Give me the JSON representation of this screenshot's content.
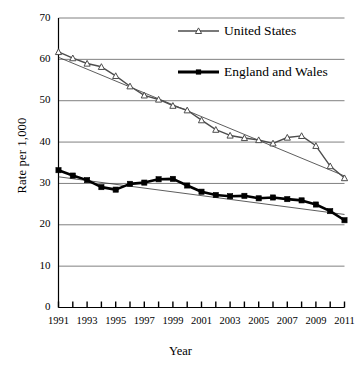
{
  "chart_data": {
    "type": "line",
    "title": "",
    "xlabel": "Year",
    "ylabel": "Rate per 1,000",
    "xlim": [
      1991,
      2011
    ],
    "ylim": [
      0,
      70
    ],
    "yticks": [
      0,
      10,
      20,
      30,
      40,
      50,
      60,
      70
    ],
    "xticks": [
      1991,
      1992,
      1993,
      1994,
      1995,
      1996,
      1997,
      1998,
      1999,
      2000,
      2001,
      2002,
      2003,
      2004,
      2005,
      2006,
      2007,
      2008,
      2009,
      2010,
      2011
    ],
    "xtick_labels_shown": [
      "1991",
      "1993",
      "1995",
      "1997",
      "1999",
      "2001",
      "2003",
      "2005",
      "2007",
      "2009",
      "2011"
    ],
    "grid": "horizontal",
    "legend_position": "upper-right-inside",
    "x": [
      1991,
      1992,
      1993,
      1994,
      1995,
      1996,
      1997,
      1998,
      1999,
      2000,
      2001,
      2002,
      2003,
      2004,
      2005,
      2006,
      2007,
      2008,
      2009,
      2010,
      2011
    ],
    "series": [
      {
        "name": "United States",
        "marker": "open-triangle",
        "color": "#4d4d4d",
        "values": [
          61.8,
          60.3,
          59.0,
          58.2,
          56.0,
          53.5,
          51.3,
          50.3,
          48.8,
          47.7,
          45.3,
          43.0,
          41.6,
          41.0,
          40.5,
          39.7,
          41.1,
          41.5,
          39.1,
          34.2,
          31.3
        ],
        "trend": {
          "type": "linear",
          "start_value": 60.5,
          "end_value": 31.8
        }
      },
      {
        "name": "England and Wales",
        "marker": "filled-square",
        "color": "#000000",
        "values": [
          33.2,
          31.9,
          30.8,
          29.1,
          28.5,
          29.9,
          30.2,
          31.0,
          31.1,
          29.5,
          28.0,
          27.2,
          26.9,
          27.0,
          26.4,
          26.6,
          26.2,
          25.9,
          24.9,
          23.3,
          21.1
        ],
        "trend": {
          "type": "linear",
          "start_value": 31.6,
          "end_value": 22.5
        }
      }
    ]
  },
  "legend": {
    "items": [
      {
        "label": "United States"
      },
      {
        "label": "England and Wales"
      }
    ]
  },
  "axes": {
    "y_title": "Rate per 1,000",
    "x_title": "Year"
  }
}
